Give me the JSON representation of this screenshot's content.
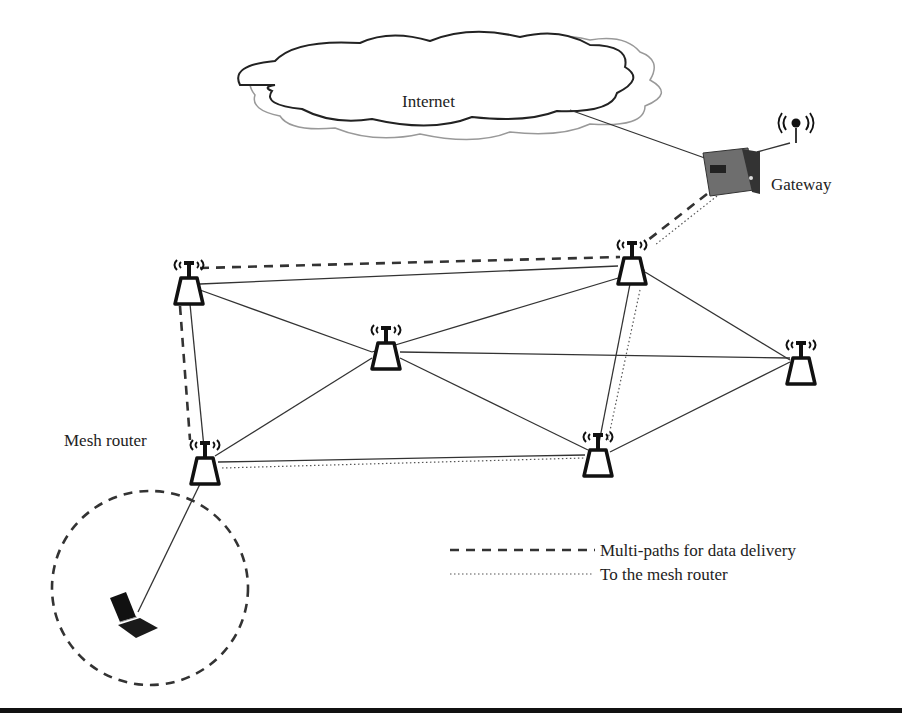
{
  "labels": {
    "internet": "Internet",
    "gateway": "Gateway",
    "mesh_router": "Mesh router"
  },
  "legend": [
    {
      "style": "dashed",
      "label": "Multi-paths for data delivery"
    },
    {
      "style": "dotted",
      "label": "To the mesh router"
    }
  ],
  "nodes": [
    {
      "id": "gateway",
      "type": "gateway",
      "x": 727,
      "y": 172
    },
    {
      "id": "r1",
      "type": "mesh-router",
      "x": 189,
      "y": 290
    },
    {
      "id": "r2",
      "type": "mesh-router",
      "x": 632,
      "y": 270
    },
    {
      "id": "r3",
      "type": "mesh-router",
      "x": 386,
      "y": 355
    },
    {
      "id": "r4",
      "type": "mesh-router",
      "x": 801,
      "y": 370
    },
    {
      "id": "r5",
      "type": "mesh-router",
      "x": 205,
      "y": 470
    },
    {
      "id": "r6",
      "type": "mesh-router",
      "x": 598,
      "y": 460
    },
    {
      "id": "laptop",
      "type": "laptop",
      "x": 130,
      "y": 625
    }
  ],
  "colors": {
    "line": "#333333",
    "background": "#ffffff",
    "gateway_box": "#6e6e6e"
  }
}
